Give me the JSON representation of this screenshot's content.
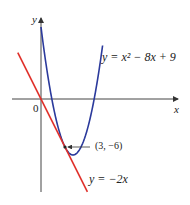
{
  "chart_data": {
    "type": "line",
    "title": "",
    "xlabel": "x",
    "ylabel": "y",
    "origin_label": "0",
    "series": [
      {
        "name": "y = x^2 - 8x + 9",
        "label": "y = x² − 8x + 9",
        "color": "#2b3a9c",
        "equation": "x^2-8x+9",
        "x_range": [
          0,
          7.7
        ]
      },
      {
        "name": "y = -2x",
        "label": "y = −2x",
        "color": "#e0302a",
        "equation": "-2x",
        "x_range": [
          -2.9,
          5.8
        ]
      }
    ],
    "annotations": [
      {
        "text": "(3, −6)",
        "x": 3,
        "y": -6,
        "type": "point-callout"
      }
    ],
    "grid": false,
    "legend": "none"
  },
  "labels": {
    "y_axis": "y",
    "x_axis": "x",
    "origin": "0",
    "parabola": "y = x² − 8x + 9",
    "line": "y = −2x",
    "point": "(3, −6)"
  }
}
